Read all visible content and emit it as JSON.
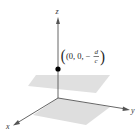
{
  "diagram": {
    "type": "3d-coordinate-axes",
    "axes": {
      "x_label": "x",
      "y_label": "y",
      "z_label": "z"
    },
    "point": {
      "label_prefix": "(0, 0, −",
      "fraction_numerator": "d",
      "fraction_denominator": "c",
      "label_suffix": ")",
      "description": "z-intercept of plane"
    },
    "planes": [
      {
        "name": "horizontal plane through point"
      },
      {
        "name": "xy-plane"
      }
    ],
    "colors": {
      "axis": "#555555",
      "plane": "#dcdcdc",
      "point": "#000000"
    }
  }
}
